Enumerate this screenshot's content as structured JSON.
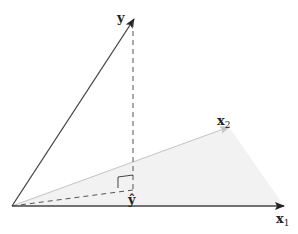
{
  "diagram": {
    "labels": {
      "y": "y",
      "x1": "x",
      "x1_sub": "1",
      "x2": "x",
      "x2_sub": "2",
      "y_hat": "ŷ"
    },
    "colors": {
      "vector": "#333333",
      "x2_vector": "#bbbbbb",
      "plane_fill": "#f0f0f0",
      "dashed": "#555555"
    },
    "points": {
      "origin": [
        12,
        206
      ],
      "y": [
        134,
        18
      ],
      "x1": [
        284,
        206
      ],
      "x2": [
        229,
        127
      ],
      "y_hat": [
        133,
        190
      ]
    }
  }
}
